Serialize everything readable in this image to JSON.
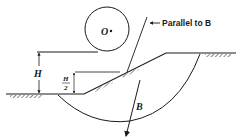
{
  "diagram": {
    "type": "slope-stability-friction-circle",
    "labels": {
      "center": "O",
      "tangent_note": "Parallel to B",
      "height": "H",
      "half_height_num": "H",
      "half_height_den": "2",
      "force": "B"
    },
    "colors": {
      "ink": "#1a1a1a",
      "background": "#ffffff"
    }
  }
}
